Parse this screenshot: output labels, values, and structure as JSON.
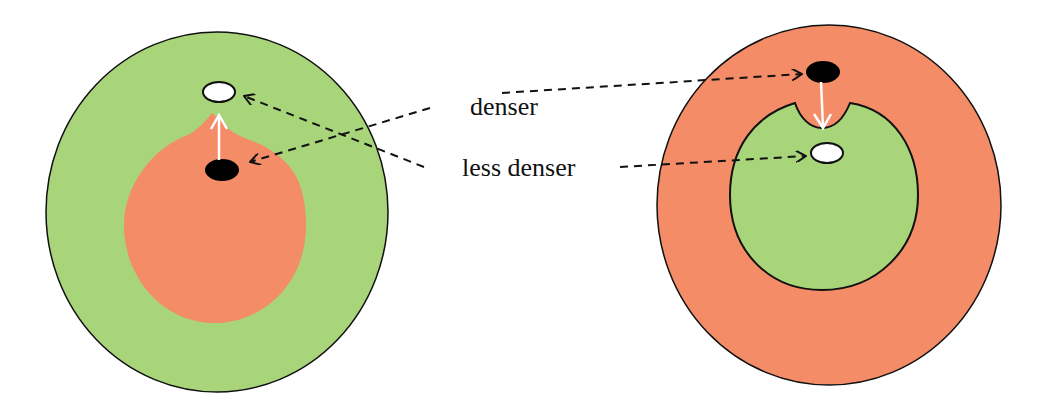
{
  "labels": {
    "denser": "denser",
    "less_denser": "less denser"
  },
  "colors": {
    "green": "#a8d47a",
    "salmon": "#f48c68",
    "outline": "#111111",
    "dense_blob": "#000000",
    "light_blob": "#ffffff",
    "motion_arrow": "#ffffff",
    "pointer_line": "#111111"
  },
  "left_figure": {
    "outer_region": "green",
    "inner_region": "salmon",
    "dense_blob_position": "inside inner salmon region",
    "light_blob_position": "in outer green region, above inner region",
    "motion_arrow_direction": "up (from dense blob toward light blob)"
  },
  "right_figure": {
    "outer_region": "salmon",
    "inner_region": "green",
    "dense_blob_position": "in outer salmon region, above inner region",
    "light_blob_position": "inside inner green region",
    "motion_arrow_direction": "down (from dense blob into notch of inner region)"
  }
}
